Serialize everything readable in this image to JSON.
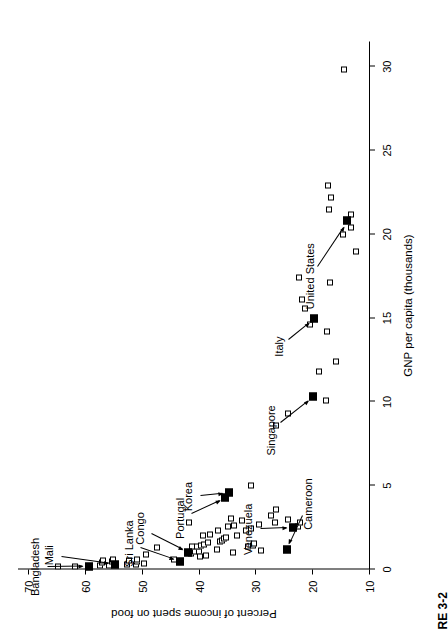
{
  "figure": {
    "caption_fragment": "RE 3-2"
  },
  "chart_data": {
    "type": "scatter",
    "title": "",
    "xlabel": "GNP per capita (thousands)",
    "ylabel": "Percent of income spent on food",
    "xlim": [
      0,
      31.5
    ],
    "ylim": [
      10,
      72
    ],
    "xticks": [
      0,
      5,
      10,
      15,
      20,
      25,
      30
    ],
    "yticks": [
      10,
      20,
      30,
      40,
      50,
      60,
      70
    ],
    "grid": false,
    "legend": null,
    "marker_styles": {
      "unlabeled": "open-square",
      "highlighted": "filled-square"
    },
    "highlighted_points": [
      {
        "label": "Bangladesh",
        "x": 0.2,
        "y": 59.5
      },
      {
        "label": "Mali",
        "x": 0.3,
        "y": 55.0
      },
      {
        "label": "Sri Lanka",
        "x": 0.5,
        "y": 43.5
      },
      {
        "label": "Congo",
        "x": 1.0,
        "y": 42.0
      },
      {
        "label": "Portugal",
        "x": 4.3,
        "y": 35.5
      },
      {
        "label": "Korea",
        "x": 4.6,
        "y": 34.8
      },
      {
        "label": "Venezuela",
        "x": 2.5,
        "y": 23.5
      },
      {
        "label": "Cameroon",
        "x": 1.2,
        "y": 24.7
      },
      {
        "label": "Singapore",
        "x": 10.3,
        "y": 20.0
      },
      {
        "label": "Italy",
        "x": 15.0,
        "y": 19.8
      },
      {
        "label": "United States",
        "x": 20.8,
        "y": 14.0
      }
    ],
    "unlabeled_points": [
      {
        "x": 0.15,
        "y": 65.0
      },
      {
        "x": 0.18,
        "y": 62.0
      },
      {
        "x": 0.22,
        "y": 57.5
      },
      {
        "x": 0.4,
        "y": 57.2
      },
      {
        "x": 0.55,
        "y": 57.0
      },
      {
        "x": 0.25,
        "y": 56.0
      },
      {
        "x": 0.45,
        "y": 55.4
      },
      {
        "x": 0.6,
        "y": 55.3
      },
      {
        "x": 0.3,
        "y": 52.8
      },
      {
        "x": 0.55,
        "y": 52.5
      },
      {
        "x": 0.3,
        "y": 51.2
      },
      {
        "x": 0.5,
        "y": 51.0
      },
      {
        "x": 0.62,
        "y": 51.0
      },
      {
        "x": 0.35,
        "y": 49.8
      },
      {
        "x": 0.9,
        "y": 49.5
      },
      {
        "x": 1.3,
        "y": 47.5
      },
      {
        "x": 0.6,
        "y": 44.5
      },
      {
        "x": 0.95,
        "y": 41.5
      },
      {
        "x": 1.05,
        "y": 40.8
      },
      {
        "x": 1.1,
        "y": 40.2
      },
      {
        "x": 0.75,
        "y": 40.0
      },
      {
        "x": 1.35,
        "y": 41.3
      },
      {
        "x": 1.4,
        "y": 40.5
      },
      {
        "x": 1.45,
        "y": 39.8
      },
      {
        "x": 1.5,
        "y": 39.2
      },
      {
        "x": 0.85,
        "y": 38.9
      },
      {
        "x": 1.6,
        "y": 38.5
      },
      {
        "x": 2.8,
        "y": 41.8
      },
      {
        "x": 2.0,
        "y": 39.5
      },
      {
        "x": 2.1,
        "y": 38.2
      },
      {
        "x": 1.2,
        "y": 37.0
      },
      {
        "x": 1.7,
        "y": 36.5
      },
      {
        "x": 1.75,
        "y": 36.1
      },
      {
        "x": 1.82,
        "y": 35.8
      },
      {
        "x": 1.9,
        "y": 35.4
      },
      {
        "x": 2.3,
        "y": 36.8
      },
      {
        "x": 2.55,
        "y": 35.0
      },
      {
        "x": 1.0,
        "y": 34.2
      },
      {
        "x": 2.05,
        "y": 33.5
      },
      {
        "x": 2.6,
        "y": 33.9
      },
      {
        "x": 3.05,
        "y": 34.5
      },
      {
        "x": 5.0,
        "y": 31.0
      },
      {
        "x": 1.35,
        "y": 31.5
      },
      {
        "x": 1.45,
        "y": 30.6
      },
      {
        "x": 1.55,
        "y": 30.5
      },
      {
        "x": 2.35,
        "y": 31.8
      },
      {
        "x": 2.45,
        "y": 31.0
      },
      {
        "x": 2.9,
        "y": 32.6
      },
      {
        "x": 1.15,
        "y": 29.2
      },
      {
        "x": 2.7,
        "y": 29.5
      },
      {
        "x": 2.8,
        "y": 26.8
      },
      {
        "x": 3.25,
        "y": 27.4
      },
      {
        "x": 3.6,
        "y": 26.5
      },
      {
        "x": 3.0,
        "y": 24.5
      },
      {
        "x": 2.55,
        "y": 22.6
      },
      {
        "x": 2.8,
        "y": 22.4
      },
      {
        "x": 8.6,
        "y": 26.5
      },
      {
        "x": 9.3,
        "y": 24.5
      },
      {
        "x": 10.1,
        "y": 17.8
      },
      {
        "x": 11.8,
        "y": 18.9
      },
      {
        "x": 12.4,
        "y": 16.0
      },
      {
        "x": 14.2,
        "y": 17.5
      },
      {
        "x": 14.6,
        "y": 20.5
      },
      {
        "x": 15.6,
        "y": 21.5
      },
      {
        "x": 16.1,
        "y": 22.0
      },
      {
        "x": 17.1,
        "y": 17.0
      },
      {
        "x": 17.4,
        "y": 22.5
      },
      {
        "x": 19.0,
        "y": 12.4
      },
      {
        "x": 20.0,
        "y": 14.8
      },
      {
        "x": 20.4,
        "y": 13.4
      },
      {
        "x": 21.2,
        "y": 13.4
      },
      {
        "x": 21.5,
        "y": 17.2
      },
      {
        "x": 22.2,
        "y": 16.9
      },
      {
        "x": 22.9,
        "y": 17.4
      },
      {
        "x": 29.8,
        "y": 14.5
      }
    ],
    "annotations": [
      {
        "label": "Bangladesh",
        "text_x": 0.15,
        "text_y": 69.0,
        "point_x": 0.2,
        "point_y": 59.5
      },
      {
        "label": "Mali",
        "text_x": 0.85,
        "text_y": 66.5,
        "point_x": 0.3,
        "point_y": 55.0
      },
      {
        "label": "Sri Lanka",
        "text_x": 1.55,
        "text_y": 52.5,
        "point_x": 0.5,
        "point_y": 43.5
      },
      {
        "label": "Congo",
        "text_x": 2.45,
        "text_y": 50.5,
        "point_x": 1.0,
        "point_y": 42.0
      },
      {
        "label": "Portugal",
        "text_x": 3.05,
        "text_y": 43.5,
        "point_x": 4.3,
        "point_y": 35.5
      },
      {
        "label": "Korea",
        "text_x": 4.35,
        "text_y": 42.0,
        "point_x": 4.6,
        "point_y": 34.8
      },
      {
        "label": "Venezuela",
        "text_x": 2.4,
        "text_y": 31.5,
        "point_x": 2.5,
        "point_y": 23.5
      },
      {
        "label": "Cameroon",
        "text_x": 3.9,
        "text_y": 21.0,
        "point_x": 1.2,
        "point_y": 24.7
      },
      {
        "label": "Singapore",
        "text_x": 8.3,
        "text_y": 27.5,
        "point_x": 10.3,
        "point_y": 20.0
      },
      {
        "label": "Italy",
        "text_x": 13.3,
        "text_y": 26.0,
        "point_x": 15.0,
        "point_y": 19.8
      },
      {
        "label": "United States",
        "text_x": 17.5,
        "text_y": 20.5,
        "point_x": 20.8,
        "point_y": 14.0
      }
    ]
  }
}
